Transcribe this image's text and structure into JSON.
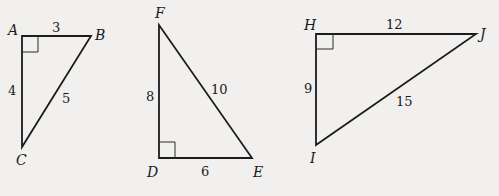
{
  "diagram": {
    "type": "right-triangles",
    "background": "#f1f0ee",
    "stroke_color": "#1c1c1c",
    "triangles": [
      {
        "name": "ABC",
        "right_angle_at": "A",
        "vertices": {
          "A": "A",
          "B": "B",
          "C": "C"
        },
        "sides": {
          "AB": "3",
          "AC": "4",
          "BC": "5"
        }
      },
      {
        "name": "DEF",
        "right_angle_at": "D",
        "vertices": {
          "F": "F",
          "D": "D",
          "E": "E"
        },
        "sides": {
          "DF": "8",
          "DE": "6",
          "EF": "10"
        }
      },
      {
        "name": "HIJ",
        "right_angle_at": "H",
        "vertices": {
          "H": "H",
          "J": "J",
          "I": "I"
        },
        "sides": {
          "HJ": "12",
          "HI": "9",
          "IJ": "15"
        }
      }
    ]
  }
}
